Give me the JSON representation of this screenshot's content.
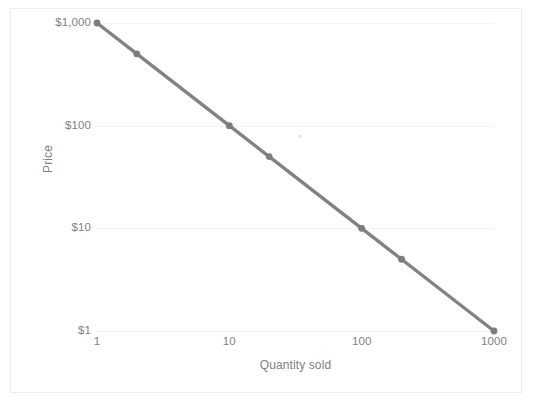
{
  "chart_data": {
    "type": "line",
    "title": "",
    "xlabel": "Quantity sold",
    "ylabel": "Price",
    "xscale": "log",
    "yscale": "log",
    "xlim": [
      1,
      1000
    ],
    "ylim": [
      1,
      1000
    ],
    "grid": true,
    "legend": false,
    "x_ticks": [
      {
        "value": 1,
        "label": "1"
      },
      {
        "value": 10,
        "label": "10"
      },
      {
        "value": 100,
        "label": "100"
      },
      {
        "value": 1000,
        "label": "1000"
      }
    ],
    "y_ticks": [
      {
        "value": 1,
        "label": "$1"
      },
      {
        "value": 10,
        "label": "$10"
      },
      {
        "value": 100,
        "label": "$100"
      },
      {
        "value": 1000,
        "label": "$1,000"
      }
    ],
    "series": [
      {
        "name": "Price vs quantity sold",
        "color": "#808285",
        "marker": "circle",
        "x": [
          1,
          2,
          10,
          20,
          100,
          200,
          1000
        ],
        "y": [
          1000,
          500,
          100,
          50,
          10,
          5,
          1
        ]
      }
    ],
    "series_colors": {
      "line": "#808285",
      "marker": "#7a7c7f",
      "gridline": "#f2f2f2",
      "frame": "#ececec",
      "tick_text": "#808284"
    }
  },
  "axes": {
    "x_title": "Quantity sold",
    "y_title": "Price"
  },
  "caption": {
    "text": ""
  }
}
